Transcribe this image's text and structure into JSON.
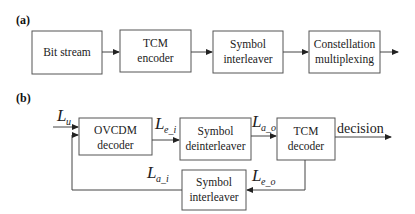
{
  "panel_a": {
    "label": "(a)",
    "blocks": [
      {
        "line1": "Bit stream",
        "line2": ""
      },
      {
        "line1": "TCM",
        "line2": "encoder"
      },
      {
        "line1": "Symbol",
        "line2": "interleaver"
      },
      {
        "line1": "Constellation",
        "line2": "multiplexing"
      }
    ]
  },
  "panel_b": {
    "label": "(b)",
    "blocks": {
      "ovcdm": {
        "line1": "OVCDM",
        "line2": "decoder"
      },
      "deinterleaver": {
        "line1": "Symbol",
        "line2": "deinterleaver"
      },
      "tcm_decoder": {
        "line1": "TCM",
        "line2": "decoder"
      },
      "interleaver": {
        "line1": "Symbol",
        "line2": "interleaver"
      }
    },
    "signals": {
      "L_u": {
        "main": "L",
        "sub": "u"
      },
      "L_e_i": {
        "main": "L",
        "sub": "e_i"
      },
      "L_a_o": {
        "main": "L",
        "sub": "a_o"
      },
      "L_a_i": {
        "main": "L",
        "sub": "a_i"
      },
      "L_e_o": {
        "main": "L",
        "sub": "e_o"
      }
    },
    "output_label": "decision"
  }
}
